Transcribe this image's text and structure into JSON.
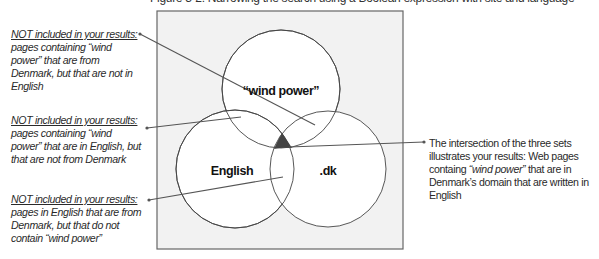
{
  "header": {
    "cutoff_text": "Figure 3-2: Narrowing the search using a Boolean expression with site and language"
  },
  "diagram": {
    "type": "venn",
    "colors": {
      "background_box": "#f2f2f2",
      "box_border": "#666666",
      "circle_fill": "#ffffff",
      "circle_stroke": "#444444",
      "intersection_fill": "#444444",
      "leader_line": "#555555"
    },
    "sets": [
      {
        "id": "wind",
        "label": "“wind power”",
        "cx": 281,
        "cy": 89,
        "r": 59
      },
      {
        "id": "english",
        "label": "English",
        "cx": 235,
        "cy": 169,
        "r": 59
      },
      {
        "id": "dk",
        "label": ".dk",
        "cx": 328,
        "cy": 169,
        "r": 58
      }
    ]
  },
  "annotations": {
    "left": [
      {
        "heading": "NOT included in your results:",
        "body": "pages containing “wind power” that are from Denmark, but that are not in English"
      },
      {
        "heading": "NOT included in your results:",
        "body": "pages containing “wind power” that are in English, but that are not from Denmark"
      },
      {
        "heading": "NOT included in your results:",
        "body": "pages in English that are from Denmark, but that do not contain “wind power”"
      }
    ],
    "right": {
      "text_before": "The intersection of the three sets illustrates your results: Web pages containg ",
      "emphasis": "“wind power”",
      "text_after": " that are in Denmark’s domain that are written in English"
    }
  }
}
